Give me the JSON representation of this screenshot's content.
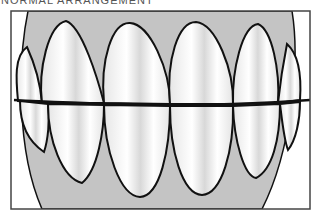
{
  "caption": {
    "text": "NORMAL ARRANGEMENT"
  },
  "figure": {
    "colors": {
      "gum": "#c4c4c4",
      "tooth": "#ffffff",
      "outline": "#111111",
      "frame": "#444444",
      "background": "#ffffff"
    },
    "upper_teeth_count": 6,
    "lower_teeth_count": 6
  }
}
